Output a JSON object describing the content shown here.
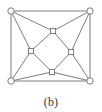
{
  "figure": {
    "caption": "(b)",
    "label": "(b)",
    "type": "graph-diagram",
    "colors": {
      "background": "#ffffff",
      "edge": "#6e6e6e",
      "node_stroke": "#6e6e6e",
      "node_fill": "#ffffff",
      "caption_text": "#3a3a3a"
    },
    "style": {
      "edge_width": 0.9,
      "node_stroke_width": 0.9,
      "circle_radius": 3.2,
      "square_size": 5.2
    }
  },
  "graph_data": {
    "type": "graph",
    "directed": false,
    "node_count": 8,
    "edge_count": 16,
    "nodes": [
      {
        "id": "c_tl",
        "label": "",
        "shape": "circle",
        "x": 11,
        "y": 11,
        "role": "outer-corner"
      },
      {
        "id": "c_tr",
        "label": "",
        "shape": "circle",
        "x": 90,
        "y": 11,
        "role": "outer-corner"
      },
      {
        "id": "c_br",
        "label": "",
        "shape": "circle",
        "x": 90,
        "y": 81,
        "role": "outer-corner"
      },
      {
        "id": "c_bl",
        "label": "",
        "shape": "circle",
        "x": 11,
        "y": 81,
        "role": "outer-corner"
      },
      {
        "id": "s_top",
        "label": "",
        "shape": "square",
        "x": 53,
        "y": 31,
        "role": "inner-diamond"
      },
      {
        "id": "s_right",
        "label": "",
        "shape": "square",
        "x": 71,
        "y": 52,
        "role": "inner-diamond"
      },
      {
        "id": "s_bottom",
        "label": "",
        "shape": "square",
        "x": 52,
        "y": 72,
        "role": "inner-diamond"
      },
      {
        "id": "s_left",
        "label": "",
        "shape": "square",
        "x": 31,
        "y": 51,
        "role": "inner-diamond"
      }
    ],
    "edges": [
      {
        "source": "c_tl",
        "target": "c_tr",
        "group": "outer-square"
      },
      {
        "source": "c_tr",
        "target": "c_br",
        "group": "outer-square"
      },
      {
        "source": "c_br",
        "target": "c_bl",
        "group": "outer-square"
      },
      {
        "source": "c_bl",
        "target": "c_tl",
        "group": "outer-square"
      },
      {
        "source": "s_top",
        "target": "s_right",
        "group": "inner-diamond"
      },
      {
        "source": "s_right",
        "target": "s_bottom",
        "group": "inner-diamond"
      },
      {
        "source": "s_bottom",
        "target": "s_left",
        "group": "inner-diamond"
      },
      {
        "source": "s_left",
        "target": "s_top",
        "group": "inner-diamond"
      },
      {
        "source": "c_tl",
        "target": "s_top",
        "group": "spoke"
      },
      {
        "source": "c_tl",
        "target": "s_left",
        "group": "spoke"
      },
      {
        "source": "c_tr",
        "target": "s_top",
        "group": "spoke"
      },
      {
        "source": "c_tr",
        "target": "s_right",
        "group": "spoke"
      },
      {
        "source": "c_br",
        "target": "s_right",
        "group": "spoke"
      },
      {
        "source": "c_br",
        "target": "s_bottom",
        "group": "spoke"
      },
      {
        "source": "c_bl",
        "target": "s_bottom",
        "group": "spoke"
      },
      {
        "source": "c_bl",
        "target": "s_left",
        "group": "spoke"
      }
    ]
  }
}
